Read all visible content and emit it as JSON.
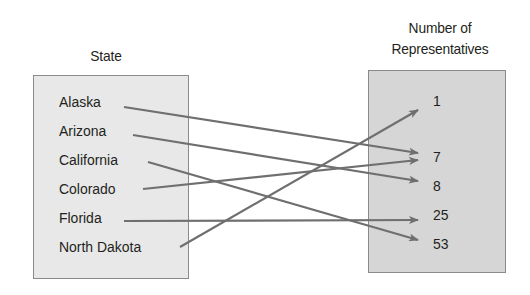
{
  "diagram": {
    "type": "mapping",
    "domain": {
      "title": "State",
      "items": [
        "Alaska",
        "Arizona",
        "California",
        "Colorado",
        "Florida",
        "North Dakota"
      ]
    },
    "range": {
      "title_line1": "Number of",
      "title_line2": "Representatives",
      "items": [
        "1",
        "7",
        "8",
        "25",
        "53"
      ]
    },
    "mappings": [
      {
        "from": "Alaska",
        "to": "7"
      },
      {
        "from": "Arizona",
        "to": "8"
      },
      {
        "from": "California",
        "to": "53"
      },
      {
        "from": "Colorado",
        "to": "7"
      },
      {
        "from": "Florida",
        "to": "25"
      },
      {
        "from": "North Dakota",
        "to": "1"
      }
    ],
    "colors": {
      "arrow": "#6f6f6f",
      "domain_box": "#e8e8e8",
      "range_box": "#d6d6d6",
      "border": "#8a8a8a",
      "text": "#231f20"
    }
  }
}
